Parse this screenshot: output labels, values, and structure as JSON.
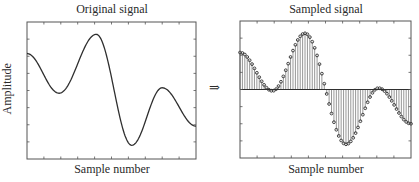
{
  "arrow": "⇒",
  "chart_data": [
    {
      "type": "line",
      "title": "Original signal",
      "xlabel": "Sample number",
      "ylabel": "Amplitude",
      "grid": false,
      "tick_labels_shown": false,
      "x_norm": [
        0.0,
        0.19,
        0.41,
        0.62,
        0.8,
        1.0
      ],
      "y_norm": [
        0.77,
        0.48,
        0.91,
        0.1,
        0.52,
        0.24
      ],
      "notes": "Smooth continuous waveform; y_norm relative to plot height (0=bottom,1=top)"
    },
    {
      "type": "stem",
      "title": "Sampled signal",
      "xlabel": "Sample number",
      "ylabel": "",
      "grid": false,
      "tick_labels_shown": false,
      "num_samples": 72,
      "baseline_norm": 0.5,
      "x_norm": [
        0.0,
        0.19,
        0.38,
        0.62,
        0.81,
        1.0
      ],
      "y_norm": [
        0.77,
        0.49,
        0.91,
        0.1,
        0.51,
        0.25
      ],
      "notes": "Same waveform sampled at discrete points with stems to a horizontal baseline"
    }
  ],
  "panels": {
    "left": {
      "title": "Original signal",
      "xlabel": "Sample number",
      "ylabel": "Amplitude"
    },
    "right": {
      "title": "Sampled signal",
      "xlabel": "Sample number"
    }
  },
  "colors": {
    "line": "#2f2f2f",
    "frame": "#555555",
    "stem": "#6a6a6a"
  }
}
